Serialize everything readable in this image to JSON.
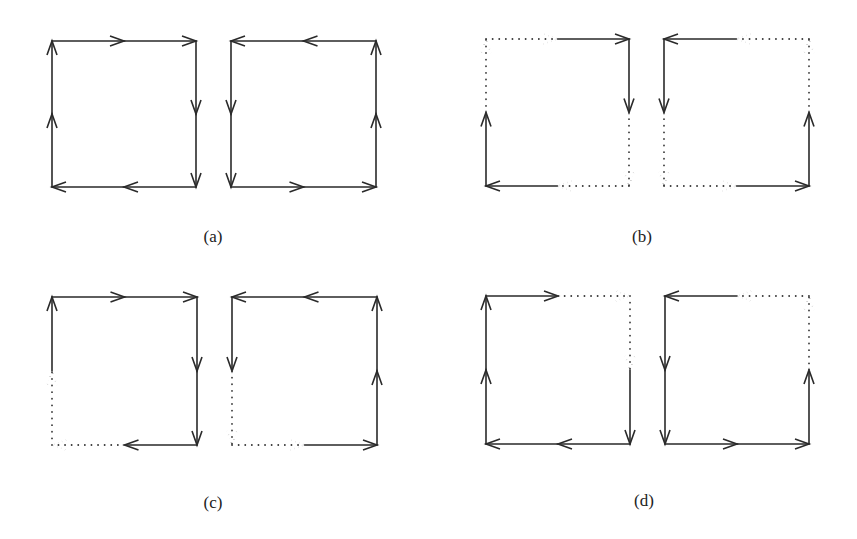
{
  "figure": {
    "width": 857,
    "height": 539,
    "stroke_color": "#2a2a2a",
    "dot_color": "#3a3a3a",
    "background": "#ffffff",
    "panels": [
      {
        "label": "(a)",
        "label_pos": [
          213,
          237
        ],
        "squares": [
          {
            "name": "left-square",
            "box": [
              52,
              41,
              196,
              187
            ],
            "orientation": "clockwise",
            "sides": {
              "top": {
                "dir": "right",
                "segments": [
                  "solid",
                  "solid"
                ]
              },
              "right": {
                "dir": "down",
                "segments": [
                  "solid",
                  "solid"
                ]
              },
              "bottom": {
                "dir": "left",
                "segments": [
                  "solid",
                  "solid"
                ]
              },
              "left": {
                "dir": "up",
                "segments": [
                  "solid",
                  "solid"
                ]
              }
            }
          },
          {
            "name": "right-square",
            "box": [
              231,
              41,
              376,
              187
            ],
            "orientation": "counterclockwise",
            "sides": {
              "top": {
                "dir": "left",
                "segments": [
                  "solid",
                  "solid"
                ]
              },
              "left": {
                "dir": "down",
                "segments": [
                  "solid",
                  "solid"
                ]
              },
              "bottom": {
                "dir": "right",
                "segments": [
                  "solid",
                  "solid"
                ]
              },
              "right": {
                "dir": "up",
                "segments": [
                  "solid",
                  "solid"
                ]
              }
            }
          }
        ]
      },
      {
        "label": "(b)",
        "label_pos": [
          642,
          237
        ],
        "squares": [
          {
            "name": "left-square",
            "box": [
              486,
              39,
              629,
              186
            ],
            "orientation": "clockwise",
            "sides": {
              "top": {
                "dir": "right",
                "segments": [
                  "dotted",
                  "solid"
                ]
              },
              "right": {
                "dir": "down",
                "segments": [
                  "solid",
                  "dotted"
                ]
              },
              "bottom": {
                "dir": "left",
                "segments": [
                  "dotted",
                  "solid"
                ]
              },
              "left": {
                "dir": "up",
                "segments": [
                  "solid",
                  "dotted"
                ]
              }
            }
          },
          {
            "name": "right-square",
            "box": [
              664,
              39,
              809,
              186
            ],
            "orientation": "counterclockwise",
            "sides": {
              "top": {
                "dir": "left",
                "segments": [
                  "dotted",
                  "solid"
                ]
              },
              "left": {
                "dir": "down",
                "segments": [
                  "solid",
                  "dotted"
                ]
              },
              "bottom": {
                "dir": "right",
                "segments": [
                  "dotted",
                  "solid"
                ]
              },
              "right": {
                "dir": "up",
                "segments": [
                  "solid",
                  "dotted"
                ]
              }
            }
          }
        ]
      },
      {
        "label": "(c)",
        "label_pos": [
          213,
          503
        ],
        "squares": [
          {
            "name": "left-square",
            "box": [
              52,
              297,
              197,
              445
            ],
            "orientation": "clockwise",
            "sides": {
              "top": {
                "dir": "right",
                "segments": [
                  "solid",
                  "solid"
                ]
              },
              "right": {
                "dir": "down",
                "segments": [
                  "solid",
                  "solid"
                ]
              },
              "bottom": {
                "dir": "left",
                "segments": [
                  "solid",
                  "dotted"
                ]
              },
              "left": {
                "dir": "up",
                "segments": [
                  "dotted",
                  "solid"
                ]
              }
            }
          },
          {
            "name": "right-square",
            "box": [
              232,
              297,
              377,
              445
            ],
            "orientation": "counterclockwise",
            "sides": {
              "top": {
                "dir": "left",
                "segments": [
                  "solid",
                  "solid"
                ]
              },
              "left": {
                "dir": "down",
                "segments": [
                  "solid",
                  "dotted"
                ]
              },
              "bottom": {
                "dir": "right",
                "segments": [
                  "dotted",
                  "solid"
                ]
              },
              "right": {
                "dir": "up",
                "segments": [
                  "solid",
                  "solid"
                ]
              }
            }
          }
        ]
      },
      {
        "label": "(d)",
        "label_pos": [
          644,
          501
        ],
        "squares": [
          {
            "name": "left-square",
            "box": [
              486,
              296,
              630,
              444
            ],
            "orientation": "clockwise",
            "sides": {
              "top": {
                "dir": "right",
                "segments": [
                  "solid",
                  "dotted"
                ]
              },
              "right": {
                "dir": "down",
                "segments": [
                  "dotted",
                  "solid"
                ]
              },
              "bottom": {
                "dir": "left",
                "segments": [
                  "solid",
                  "solid"
                ]
              },
              "left": {
                "dir": "up",
                "segments": [
                  "solid",
                  "solid"
                ]
              }
            }
          },
          {
            "name": "right-square",
            "box": [
              665,
              296,
              809,
              444
            ],
            "orientation": "counterclockwise",
            "sides": {
              "top": {
                "dir": "left",
                "segments": [
                  "dotted",
                  "solid"
                ]
              },
              "left": {
                "dir": "down",
                "segments": [
                  "solid",
                  "solid"
                ]
              },
              "bottom": {
                "dir": "right",
                "segments": [
                  "solid",
                  "solid"
                ]
              },
              "right": {
                "dir": "up",
                "segments": [
                  "solid",
                  "dotted"
                ]
              }
            }
          }
        ]
      }
    ]
  }
}
